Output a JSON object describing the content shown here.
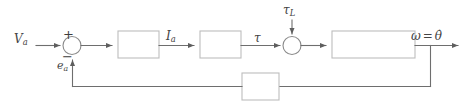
{
  "diagram": {
    "type": "control-system-block-diagram",
    "background_color": "#ffffff",
    "line_color": "#6b6b6b",
    "box_stroke_color": "#b9b9b9",
    "text_color": "#444444",
    "labels": {
      "input_voltage": "V",
      "input_voltage_sub": "a",
      "back_emf": "e",
      "back_emf_sub": "a",
      "armature_current": "I",
      "armature_current_sub": "a",
      "torque": "τ",
      "load_torque": "τ",
      "load_torque_sub": "L",
      "output_omega": "ω",
      "output_equals": "=",
      "output_theta_dot": "θ̇",
      "sum_plus": "+",
      "sum_minus": "−"
    },
    "blocks": [
      {
        "id": "block-1",
        "label": "",
        "x": 118,
        "y": 31,
        "w": 41,
        "h": 27
      },
      {
        "id": "block-2",
        "label": "",
        "x": 200,
        "y": 31,
        "w": 41,
        "h": 27
      },
      {
        "id": "block-3",
        "label": "",
        "x": 332,
        "y": 31,
        "w": 83,
        "h": 27
      },
      {
        "id": "block-feedback",
        "label": "",
        "x": 242,
        "y": 73,
        "w": 37,
        "h": 27
      }
    ],
    "summing_junctions": [
      {
        "id": "sum-1",
        "cx": 72,
        "cy": 45,
        "r": 9
      },
      {
        "id": "sum-2",
        "cx": 292,
        "cy": 45,
        "r": 9
      }
    ]
  }
}
